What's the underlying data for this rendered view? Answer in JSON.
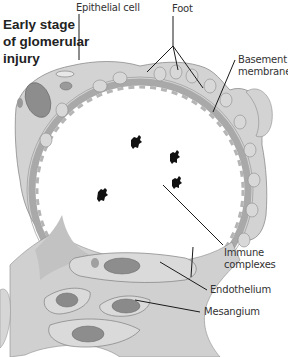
{
  "title": {
    "lines": [
      "Early stage",
      "of glomerular",
      "injury"
    ]
  },
  "labels": {
    "epithelial_cell": "Epithelial cell",
    "foot": "Foot",
    "basement_membrane": [
      "Basement",
      "membrane"
    ],
    "immune_complexes": [
      "Immune",
      "complexes"
    ],
    "endothelium": "Endothelium",
    "mesangium": "Mesangium"
  },
  "colors": {
    "tissue": "#c9c9c9",
    "membrane": "#a9a9a9",
    "cytoplasm": "#dcdcdc",
    "nucleus": "#8a8a8a",
    "leader_line": "#1a1a1a",
    "text": "#333333",
    "background": "#ffffff"
  }
}
